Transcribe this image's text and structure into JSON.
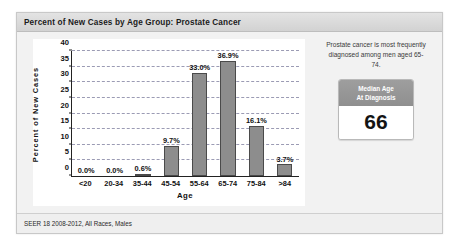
{
  "header": {
    "title": "Percent of New Cases by Age Group: Prostate Cancer"
  },
  "footer": {
    "source": "SEER 18 2008-2012, All Races, Males"
  },
  "side_panel": {
    "note": "Prostate cancer is most frequently diagnosed among men aged 65-74.",
    "stat_card": {
      "header_line1": "Median Age",
      "header_line2": "At Diagnosis",
      "value": "66"
    }
  },
  "colors": {
    "bar_fill": "#8d8d8d",
    "bar_border": "#4a4a4a",
    "gridline": "#9b9bb4",
    "card_header": "#d2d2d2",
    "stat_header": "#8f8f8f"
  },
  "chart_data": {
    "type": "bar",
    "title": "Percent of New Cases by Age Group: Prostate Cancer",
    "xlabel": "Age",
    "ylabel": "Percent of New Cases",
    "ylim": [
      0,
      40
    ],
    "yticks": [
      0,
      5,
      10,
      15,
      20,
      25,
      30,
      35,
      40
    ],
    "ytick_labels": [
      "0",
      "5",
      "10",
      "15",
      "20",
      "25",
      "30",
      "35",
      "40"
    ],
    "grid": true,
    "legend": null,
    "categories": [
      "<20",
      "20-34",
      "35-44",
      "45-54",
      "55-64",
      "65-74",
      "75-84",
      ">84"
    ],
    "values": [
      0.0,
      0.0,
      0.6,
      9.7,
      33.0,
      36.9,
      16.1,
      3.7
    ],
    "data_labels": [
      "0.0%",
      "0.0%",
      "0.6%",
      "9.7%",
      "33.0%",
      "36.9%",
      "16.1%",
      "3.7%"
    ]
  }
}
